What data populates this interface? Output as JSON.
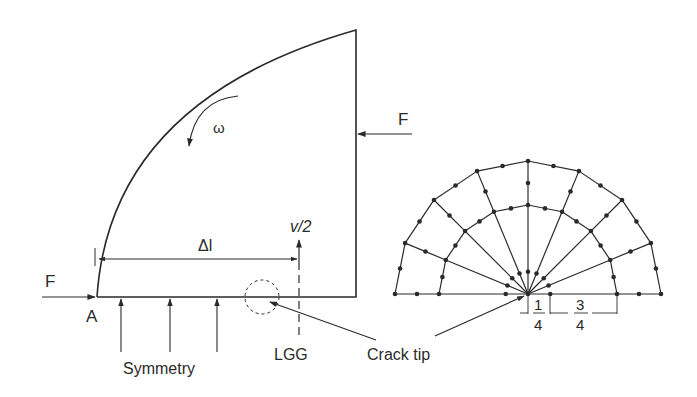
{
  "left_figure": {
    "labels": {
      "force_left": "F",
      "force_right": "F",
      "point_a": "A",
      "omega": "ω",
      "delta_l": "Δl",
      "v_half": "v/2",
      "symmetry": "Symmetry",
      "lgg": "LGG",
      "crack_tip": "Crack tip"
    },
    "symmetry_arrow_count": 3
  },
  "right_figure": {
    "mesh": {
      "type": "quarter-point crack-tip rosette mesh",
      "radial_divisions": 8,
      "rings": 2
    },
    "dimension_labels": {
      "left_num": "1",
      "left_den": "4",
      "right_num": "3",
      "right_den": "4"
    }
  },
  "colors": {
    "line": "#2a2a2a",
    "background": "#ffffff"
  }
}
